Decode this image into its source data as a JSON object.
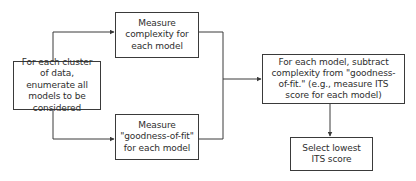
{
  "diagram": {
    "type": "flowchart",
    "colors": {
      "stroke": "#3a3a3a",
      "text": "#2e2e2e",
      "background": "#ffffff"
    },
    "nodes": [
      {
        "id": "enumerate",
        "label": "For each cluster of data, enumerate all models to be considered"
      },
      {
        "id": "complexity",
        "label": "Measure complexity for each model"
      },
      {
        "id": "goodness",
        "label": "Measure \"goodness-of-fit\" for each model"
      },
      {
        "id": "subtract",
        "label": "For each model, subtract complexity from \"goodness-of-fit.\" (e.g., measure ITS score for each model)"
      },
      {
        "id": "select",
        "label": "Select lowest ITS score"
      }
    ],
    "edges": [
      {
        "from": "enumerate",
        "to": "complexity"
      },
      {
        "from": "enumerate",
        "to": "goodness"
      },
      {
        "from": "complexity",
        "to": "subtract"
      },
      {
        "from": "goodness",
        "to": "subtract"
      },
      {
        "from": "subtract",
        "to": "select"
      }
    ]
  }
}
